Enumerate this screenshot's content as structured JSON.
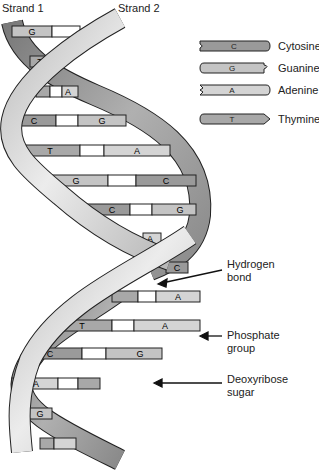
{
  "strands": {
    "strand1": "Strand 1",
    "strand2": "Strand 2"
  },
  "legend": [
    {
      "letter": "C",
      "name": "Cytosine",
      "color": "#9a9a9a"
    },
    {
      "letter": "G",
      "name": "Guanine",
      "color": "#c4c4c4"
    },
    {
      "letter": "A",
      "name": "Adenine",
      "color": "#d4d4d4"
    },
    {
      "letter": "T",
      "name": "Thymine",
      "color": "#a8a8a8"
    }
  ],
  "base_pairs": [
    {
      "left": "G",
      "right": "C"
    },
    {
      "left": "T",
      "right": "A"
    },
    {
      "left": "T",
      "right": "A"
    },
    {
      "left": "C",
      "right": "G"
    },
    {
      "left": "T",
      "right": "A"
    },
    {
      "left": "G",
      "right": "C"
    },
    {
      "left": "C",
      "right": "G"
    },
    {
      "left": "A",
      "right": "T"
    },
    {
      "left": "G",
      "right": "C"
    },
    {
      "left": "T",
      "right": "A"
    },
    {
      "left": "T",
      "right": "A"
    },
    {
      "left": "C",
      "right": "G"
    },
    {
      "left": "A",
      "right": "T"
    },
    {
      "left": "G",
      "right": "C"
    },
    {
      "left": "T",
      "right": "A"
    }
  ],
  "callouts": {
    "hydrogen": {
      "line1": "Hydrogen",
      "line2": "bond"
    },
    "phosphate": {
      "line1": "Phosphate",
      "line2": "group"
    },
    "sugar": {
      "line1": "Deoxyribose",
      "line2": "sugar"
    }
  },
  "colors": {
    "outline": "#222222",
    "ribbon_dark": "#8a8a8a",
    "ribbon_light": "#d8d8d8",
    "background": "#ffffff"
  }
}
